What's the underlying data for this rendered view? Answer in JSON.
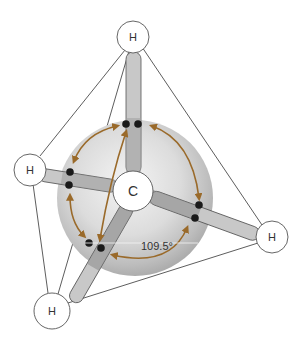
{
  "diagram": {
    "type": "tetrahedral-molecule",
    "molecule": "methane",
    "central_atom": {
      "label": "C",
      "x": 133,
      "y": 191,
      "r": 20
    },
    "hydrogens": [
      {
        "id": "top",
        "label": "H",
        "x": 133,
        "y": 37,
        "r": 16
      },
      {
        "id": "left",
        "label": "H",
        "x": 30,
        "y": 170,
        "r": 16
      },
      {
        "id": "right",
        "label": "H",
        "x": 272,
        "y": 237,
        "r": 16
      },
      {
        "id": "bottom",
        "label": "H",
        "x": 52,
        "y": 311,
        "r": 18
      }
    ],
    "angle_label": "109.5°",
    "colors": {
      "arrow": "#9a6a2a",
      "bond_fill": "#c9c9c9",
      "bond_shadow": "#8f8f8f",
      "sphere_light": "#f2f2f2",
      "sphere_dark": "#a8a8a8",
      "electron": "#1a1a1a",
      "edge": "#333333"
    }
  }
}
